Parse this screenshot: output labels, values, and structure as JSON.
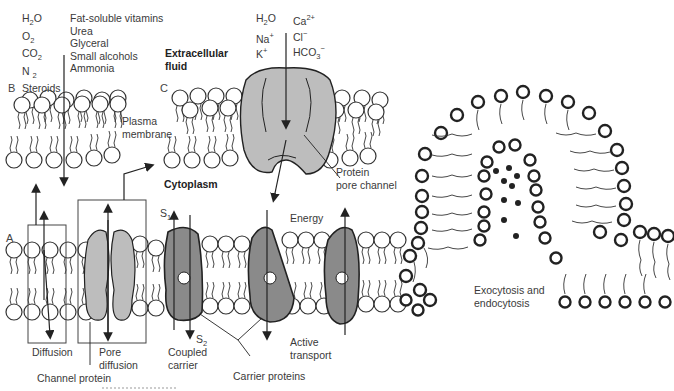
{
  "figure": {
    "panel_letters": {
      "a": "A",
      "b": "B",
      "c": "C"
    },
    "panel_b": {
      "molecules_left": [
        "H2O",
        "O2",
        "CO2",
        "N2",
        "Steroids"
      ],
      "molecules_right": [
        "Fat-soluble vitamins",
        "Urea",
        "Glyceral",
        "Small alcohols",
        "Ammonia"
      ],
      "membrane_label_1": "Plasma",
      "membrane_label_2": "membrane"
    },
    "panel_c": {
      "ions_left": [
        "H2O",
        "Na+",
        "K+"
      ],
      "ions_right": [
        "Ca2+",
        "Cl−",
        "HCO3−"
      ],
      "extracellular_1": "Extracellular",
      "extracellular_2": "fluid",
      "cytoplasm": "Cytoplasm",
      "protein_label_1": "Protein",
      "protein_label_2": "pore channel"
    },
    "panel_a": {
      "diffusion": "Diffusion",
      "pore_1": "Pore",
      "pore_2": "diffusion",
      "channel_protein": "Channel protein",
      "s1": "S",
      "s1_sub": "1",
      "s2": "S",
      "s2_sub": "2",
      "coupled_1": "Coupled",
      "coupled_2": "carrier",
      "energy": "Energy",
      "active_1": "Active",
      "active_2": "transport",
      "carrier_proteins": "Carrier proteins"
    },
    "exocytosis": {
      "label_1": "Exocytosis and",
      "label_2": "endocytosis"
    },
    "colors": {
      "protein_light": "#bdbdbd",
      "protein_dark": "#8a8a8a",
      "line": "#222222"
    }
  }
}
